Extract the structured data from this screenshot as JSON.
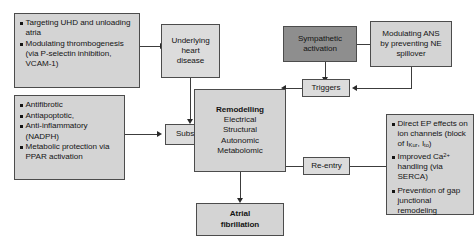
{
  "diagram": {
    "colors": {
      "box_fill": "#d4d4d4",
      "box_fill_light": "#dcdcdc",
      "box_fill_dark": "#8e8e8e",
      "border": "#4c4c4c",
      "text": "#141414",
      "connector": "#3c3c3c"
    },
    "nodes": {
      "targeting_uhd": {
        "type": "bullets",
        "items": [
          "Targeting UHD and unloading atria",
          "Modulating thrombogenesis (via P-selectin inhibition, VCAM-1)"
        ]
      },
      "underlying_heart_disease": {
        "type": "center",
        "lines": [
          "Underlying",
          "heart",
          "disease"
        ]
      },
      "antifibrotic": {
        "type": "bullets",
        "items": [
          "Antifibrotic",
          "Antiapoptotic,",
          "Anti-inflammatory (NADPH)",
          "Metabolic protection via PPAR activation"
        ]
      },
      "substrate": {
        "type": "center",
        "label": "Substrate"
      },
      "remodelling": {
        "type": "center",
        "heading": "Remodelling",
        "lines": [
          "Electrical",
          "Structural",
          "Autonomic",
          "Metabolomic"
        ]
      },
      "sympathetic_activation": {
        "type": "center",
        "lines": [
          "Sympathetic",
          "activation"
        ]
      },
      "modulating_ans": {
        "type": "center",
        "lines": [
          "Modulating ANS",
          "by preventing NE",
          "spillover"
        ]
      },
      "triggers": {
        "type": "center",
        "label": "Triggers"
      },
      "re_entry": {
        "type": "center",
        "label": "Re-entry"
      },
      "direct_ep_effects": {
        "type": "bullets",
        "items": [
          {
            "segments": [
              {
                "text": "Direct EP effects on ion channels (block of "
              },
              {
                "text": "I",
                "style": "normal"
              },
              {
                "text": "Kur",
                "style": "sub"
              },
              {
                "text": ", "
              },
              {
                "text": "I",
                "style": "normal"
              },
              {
                "text": "to",
                "style": "sub"
              },
              {
                "text": ")"
              }
            ]
          },
          {
            "segments": [
              {
                "text": "Improved Ca"
              },
              {
                "text": "2+",
                "style": "sup"
              },
              {
                "text": " handling (via SERCA)"
              }
            ]
          },
          {
            "segments": [
              {
                "text": "Prevention of gap junctional remodeling"
              }
            ]
          }
        ]
      },
      "atrial_fibrillation": {
        "type": "center",
        "lines": [
          "Atrial",
          "fibrillation"
        ]
      }
    }
  }
}
